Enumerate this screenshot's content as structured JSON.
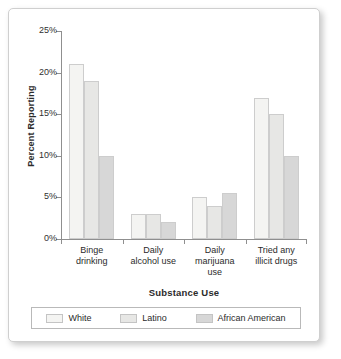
{
  "chart_data": {
    "type": "bar",
    "title": "",
    "xlabel": "Substance Use",
    "ylabel": "Percent Reporting",
    "categories": [
      "Binge drinking",
      "Daily alcohol use",
      "Daily marijuana use",
      "Tried any illicit drugs"
    ],
    "category_lines": [
      [
        "Binge",
        "drinking"
      ],
      [
        "Daily",
        "alcohol use"
      ],
      [
        "Daily",
        "marijuana",
        "use"
      ],
      [
        "Tried any",
        "illicit drugs"
      ]
    ],
    "series": [
      {
        "name": "White",
        "values": [
          21,
          3,
          5,
          17
        ]
      },
      {
        "name": "Latino",
        "values": [
          19,
          3,
          4,
          15
        ]
      },
      {
        "name": "African American",
        "values": [
          10,
          2,
          5.5,
          10
        ]
      }
    ],
    "ylim": [
      0,
      25
    ],
    "yticks": [
      0,
      5,
      10,
      15,
      20,
      25
    ],
    "ytick_labels": [
      "0%",
      "5%",
      "10%",
      "15%",
      "20%",
      "25%"
    ],
    "grid": false,
    "legend_position": "bottom",
    "colors": {
      "White": "#f4f4f2",
      "Latino": "#e7e7e5",
      "African American": "#d7d7d7",
      "bar_border": "#cdcdcd",
      "axis": "#8f8f8f",
      "text": "#2b2b2b",
      "card_background": "#ffffff",
      "card_border": "#cfcfcf"
    }
  }
}
